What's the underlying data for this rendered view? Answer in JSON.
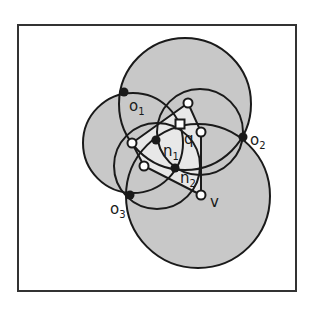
{
  "colors": {
    "background": "#ffffff",
    "frame": "#333333",
    "region_fill": "#c8c8c8",
    "triangle_fill": "#e8e8e8",
    "stroke": "#1a1a1a",
    "filled_point": "#1a1a1a",
    "open_point": "#ffffff"
  },
  "frame": {
    "x": 18,
    "y": 25,
    "width": 278,
    "height": 266
  },
  "circles": [
    {
      "id": "upper",
      "cx": 185,
      "cy": 104,
      "r": 66
    },
    {
      "id": "lower",
      "cx": 198,
      "cy": 196,
      "r": 72
    },
    {
      "id": "left",
      "cx": 133,
      "cy": 143,
      "r": 50
    },
    {
      "id": "right-inner",
      "cx": 200,
      "cy": 132,
      "r": 43
    },
    {
      "id": "left-inner",
      "cx": 157,
      "cy": 166,
      "r": 43
    }
  ],
  "triangle": {
    "points": "132,143 188,103 201,132 201,195 144,166"
  },
  "points": {
    "filled": [
      {
        "id": "o1",
        "x": 124,
        "y": 92
      },
      {
        "id": "o2",
        "x": 243,
        "y": 137
      },
      {
        "id": "o3",
        "x": 130,
        "y": 195
      },
      {
        "id": "n1",
        "x": 156,
        "y": 140
      },
      {
        "id": "n2",
        "x": 175,
        "y": 168
      }
    ],
    "open": [
      {
        "id": "top",
        "x": 188,
        "y": 103
      },
      {
        "id": "right",
        "x": 201,
        "y": 132
      },
      {
        "id": "left",
        "x": 132,
        "y": 143
      },
      {
        "id": "lower-left",
        "x": 144,
        "y": 166
      },
      {
        "id": "v",
        "x": 201,
        "y": 195
      }
    ],
    "query": {
      "id": "q",
      "x": 180,
      "y": 124,
      "size": 9
    }
  },
  "labels": {
    "o1": {
      "base": "o",
      "sub": "1"
    },
    "o2": {
      "base": "o",
      "sub": "2"
    },
    "o3": {
      "base": "o",
      "sub": "3"
    },
    "n1": {
      "base": "n",
      "sub": "1"
    },
    "n2": {
      "base": "n",
      "sub": "2"
    },
    "q": "q",
    "v": "v"
  }
}
